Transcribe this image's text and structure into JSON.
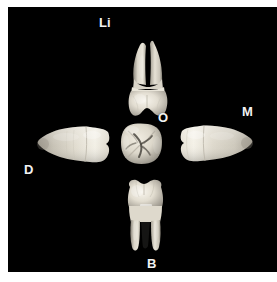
{
  "figure": {
    "domain_description": "dental anatomy specimen plate",
    "background_color": "#000000",
    "border_color": "#ffffff",
    "label_color": "#f2f2f2"
  },
  "labels": {
    "lingual": "Li",
    "mesial": "M",
    "occlusal": "O",
    "distal": "D",
    "buccal": "B"
  },
  "specimens": [
    {
      "id": "lingual-view",
      "name": "tooth-lingual-view",
      "position": "top",
      "description": "molar, lingual aspect, two roots splayed upward, crown below"
    },
    {
      "id": "mesial-view",
      "name": "tooth-mesial-view",
      "position": "right",
      "description": "molar, mesial aspect, crown left, fused root tapering right"
    },
    {
      "id": "occlusal-view",
      "name": "tooth-occlusal-view",
      "position": "center",
      "description": "molar, occlusal aspect, rounded-square crown with central fissure pattern"
    },
    {
      "id": "distal-view",
      "name": "tooth-distal-view",
      "position": "left",
      "description": "molar, distal aspect, crown right, fused root tapering left"
    },
    {
      "id": "buccal-view",
      "name": "tooth-buccal-view",
      "position": "bottom",
      "description": "molar, buccal aspect, crown above, two roots descending"
    }
  ]
}
